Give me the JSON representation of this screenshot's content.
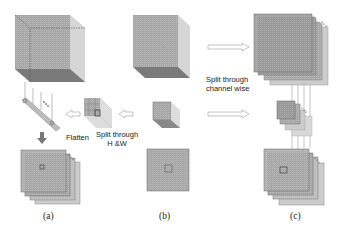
{
  "labels": {
    "flatten": "Flatten",
    "split_hw_line1": "Split through",
    "split_hw_line2": "H &W",
    "split_channel_line1": "Split through",
    "split_channel_line2": "channel wise"
  },
  "captions": {
    "a": "(a)",
    "b": "(b)",
    "c": "(c)"
  },
  "colors": {
    "cube_front": "#a9a9a9",
    "cube_side": "#d2d2d2",
    "cube_bottom": "#7f7f7f",
    "plane_fill": "#b8b8b8",
    "outline": "#555555"
  },
  "icons": [
    "hollow-arrow-left",
    "hollow-arrow-right",
    "down-arrow",
    "ellipsis-dots"
  ]
}
